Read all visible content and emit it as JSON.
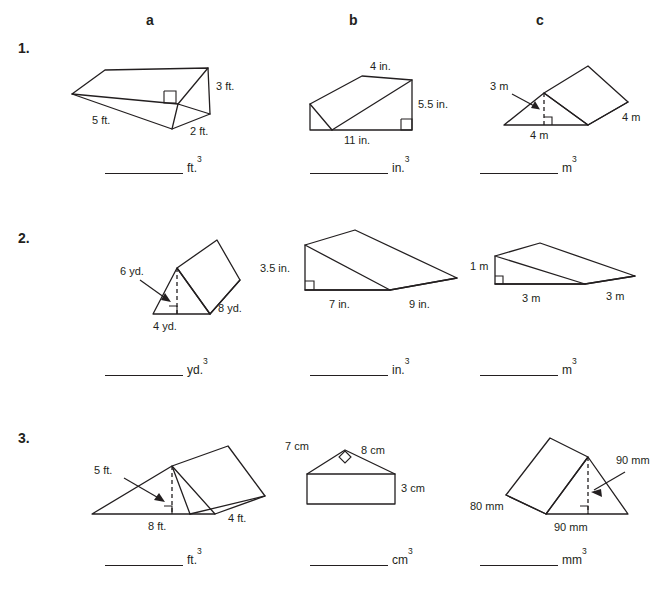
{
  "worksheet": {
    "column_headers": [
      "a",
      "b",
      "c"
    ],
    "row_numbers": [
      "1.",
      "2.",
      "3."
    ]
  },
  "figures": {
    "r1a": {
      "name": "triangular-prism-lying",
      "labels": [
        "3 ft.",
        "5 ft.",
        "2 ft."
      ],
      "dimensions": {
        "height": "3 ft.",
        "slant": "5 ft.",
        "base": "2 ft."
      },
      "answer_unit": "ft.",
      "answer_exponent": "3"
    },
    "r1b": {
      "name": "triangular-wedge",
      "labels": [
        "4 in.",
        "5.5 in.",
        "11 in."
      ],
      "dimensions": {
        "depth": "4 in.",
        "height": "5.5 in.",
        "base": "11 in."
      },
      "answer_unit": "in.",
      "answer_exponent": "3"
    },
    "r1c": {
      "name": "tent-prism",
      "labels": [
        "3 m",
        "4 m",
        "4 m"
      ],
      "dimensions": {
        "triangle_height": "3 m",
        "triangle_base": "4 m",
        "length": "4 m"
      },
      "answer_unit": "m",
      "answer_exponent": "3"
    },
    "r2a": {
      "name": "tent-prism-tilted",
      "labels": [
        "6 yd.",
        "8 yd.",
        "4 yd."
      ],
      "dimensions": {
        "triangle_height": "6 yd.",
        "length": "8 yd.",
        "triangle_base": "4 yd."
      },
      "answer_unit": "yd.",
      "answer_exponent": "3"
    },
    "r2b": {
      "name": "triangular-wedge",
      "labels": [
        "3.5 in.",
        "9 in.",
        "7 in."
      ],
      "dimensions": {
        "height": "3.5 in.",
        "depth": "9 in.",
        "base": "7 in."
      },
      "answer_unit": "in.",
      "answer_exponent": "3"
    },
    "r2c": {
      "name": "triangular-wedge-flat",
      "labels": [
        "1 m",
        "3 m",
        "3 m"
      ],
      "dimensions": {
        "height": "1 m",
        "base": "3 m",
        "depth": "3 m"
      },
      "answer_unit": "m",
      "answer_exponent": "3"
    },
    "r3a": {
      "name": "tent-prism",
      "labels": [
        "5 ft.",
        "8 ft.",
        "4 ft."
      ],
      "dimensions": {
        "triangle_height": "5 ft.",
        "triangle_base": "8 ft.",
        "length": "4 ft."
      },
      "answer_unit": "ft.",
      "answer_exponent": "3"
    },
    "r3b": {
      "name": "house-shape-prism",
      "labels": [
        "7 cm",
        "8 cm",
        "3 cm"
      ],
      "dimensions": {
        "left_slant": "7 cm",
        "right_slant": "8 cm",
        "rect_height": "3 cm"
      },
      "answer_unit": "cm",
      "answer_exponent": "3"
    },
    "r3c": {
      "name": "tent-prism",
      "labels": [
        "90 mm",
        "80 mm",
        "90 mm"
      ],
      "dimensions": {
        "triangle_height": "90 mm",
        "length": "80 mm",
        "triangle_base": "90 mm"
      },
      "answer_unit": "mm",
      "answer_exponent": "3"
    }
  }
}
